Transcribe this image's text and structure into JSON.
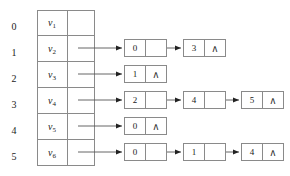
{
  "diagram": {
    "type": "adjacency-list",
    "colors": {
      "line": "#8a8a8a",
      "arrow": "#222222",
      "text": "#1a1a1a",
      "background": "#ffffff"
    },
    "null_symbol": "∧",
    "index_labels": [
      "0",
      "1",
      "2",
      "3",
      "4",
      "5"
    ],
    "vertex_labels": [
      {
        "base": "v",
        "sub": "1"
      },
      {
        "base": "v",
        "sub": "2"
      },
      {
        "base": "v",
        "sub": "3"
      },
      {
        "base": "v",
        "sub": "4"
      },
      {
        "base": "v",
        "sub": "5"
      },
      {
        "base": "v",
        "sub": "6"
      }
    ],
    "rows": [
      {
        "index": "0",
        "vertex": "v1",
        "nodes": []
      },
      {
        "index": "1",
        "vertex": "v2",
        "nodes": [
          {
            "value": "0",
            "next": "link"
          },
          {
            "value": "3",
            "next": "null"
          }
        ]
      },
      {
        "index": "2",
        "vertex": "v3",
        "nodes": [
          {
            "value": "1",
            "next": "null"
          }
        ]
      },
      {
        "index": "3",
        "vertex": "v4",
        "nodes": [
          {
            "value": "2",
            "next": "link"
          },
          {
            "value": "4",
            "next": "link"
          },
          {
            "value": "5",
            "next": "null"
          }
        ]
      },
      {
        "index": "4",
        "vertex": "v5",
        "nodes": [
          {
            "value": "0",
            "next": "null"
          }
        ]
      },
      {
        "index": "5",
        "vertex": "v6",
        "nodes": [
          {
            "value": "0",
            "next": "link"
          },
          {
            "value": "1",
            "next": "link"
          },
          {
            "value": "4",
            "next": "null"
          }
        ]
      }
    ]
  }
}
